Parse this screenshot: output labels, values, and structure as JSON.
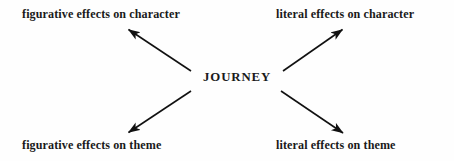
{
  "diagram": {
    "type": "concept-map",
    "background_color": "#fefefe",
    "text_color": "#1a1a1a",
    "center": {
      "label": "JOURNEY",
      "x": 237,
      "y": 77
    },
    "branches": [
      {
        "id": "figurative-effects-on-character",
        "label": "figurative effects on character",
        "position": "top-left",
        "arrow": {
          "from_x": 191,
          "from_y": 71,
          "to_x": 125,
          "to_y": 27,
          "direction": "outward"
        }
      },
      {
        "id": "literal-effects-on-character",
        "label": "literal effects on character",
        "position": "top-right",
        "arrow": {
          "from_x": 283,
          "from_y": 71,
          "to_x": 346,
          "to_y": 27,
          "direction": "outward"
        }
      },
      {
        "id": "figurative-effects-on-theme",
        "label": "figurative effects on theme",
        "position": "bottom-left",
        "arrow": {
          "from_x": 191,
          "from_y": 91,
          "to_x": 125,
          "to_y": 135,
          "direction": "outward"
        }
      },
      {
        "id": "literal-effects-on-theme",
        "label": "literal effects on theme",
        "position": "bottom-right",
        "arrow": {
          "from_x": 281,
          "from_y": 91,
          "to_x": 347,
          "to_y": 136,
          "direction": "outward"
        }
      }
    ],
    "arrow_style": {
      "color": "#111111",
      "stroke_width": 1.6,
      "head": "solid-triangle"
    }
  }
}
